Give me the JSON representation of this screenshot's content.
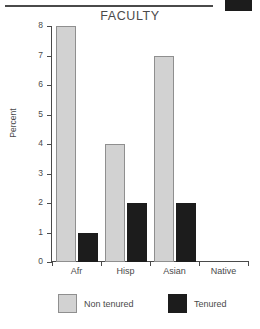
{
  "scan": {
    "rule_name": "horizontal-rule",
    "block_name": "dark-block",
    "rule_color": "#4a4a4a",
    "block_color": "#1c1c1c"
  },
  "chart_data": {
    "type": "bar",
    "title": "FACULTY",
    "xlabel": "",
    "ylabel": "Percent",
    "categories": [
      "Afr",
      "Hisp",
      "Asian",
      "Native"
    ],
    "series": [
      {
        "name": "Non tenured",
        "color": "#d2d2d2",
        "values": [
          8,
          4,
          7,
          0
        ]
      },
      {
        "name": "Tenured",
        "color": "#1c1c1c",
        "values": [
          1,
          2,
          2,
          0
        ]
      }
    ],
    "ylim": [
      0,
      8
    ],
    "yticks": [
      0,
      1,
      2,
      3,
      4,
      5,
      6,
      7,
      8
    ],
    "ytick_labels": [
      "0",
      "1",
      "2",
      "3",
      "4",
      "5",
      "6",
      "7",
      "8"
    ],
    "grid": false,
    "legend_position": "bottom"
  }
}
